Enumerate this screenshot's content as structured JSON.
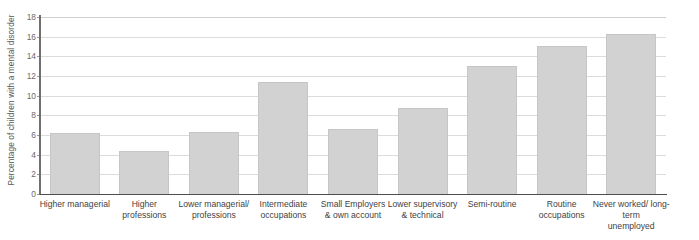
{
  "chart_data": {
    "type": "bar",
    "title": "",
    "xlabel": "",
    "ylabel": "Percentage of children with a mental disorder",
    "ylim": [
      0,
      18
    ],
    "ytick_step": 2,
    "yticks": [
      18,
      16,
      14,
      12,
      10,
      8,
      6,
      4,
      2,
      0
    ],
    "grid": true,
    "legend": null,
    "bar_color": "#d2d2d2",
    "bar_border_color": "#c6c6c6",
    "axis_color": "#4d4d4d",
    "gridline_color": "#dcdcdc",
    "categories": [
      "Higher managerial",
      "Higher professions",
      "Lower managerial/ professions",
      "Intermediate occupations",
      "Small Employers & own account",
      "Lower supervisory & technical",
      "Semi-routine",
      "Routine occupations",
      "Never worked/ long-term unemployed"
    ],
    "category_lines": [
      [
        "Higher managerial"
      ],
      [
        "Higher",
        "professions"
      ],
      [
        "Lower managerial/",
        "professions"
      ],
      [
        "Intermediate",
        "occupations"
      ],
      [
        "Small Employers",
        "& own account"
      ],
      [
        "Lower supervisory",
        "& technical"
      ],
      [
        "Semi-routine"
      ],
      [
        "Routine",
        "occupations"
      ],
      [
        "Never worked/ long-term",
        "unemployed"
      ]
    ],
    "values": [
      6.2,
      4.4,
      6.3,
      11.4,
      6.6,
      8.7,
      13.0,
      15.1,
      16.3
    ]
  }
}
